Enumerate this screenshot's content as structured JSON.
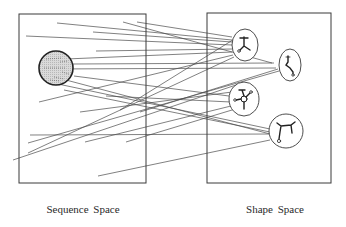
{
  "labels": {
    "sequence_space": "Sequence Space",
    "shape_space": "Shape Space"
  },
  "colors": {
    "stroke": "#3a3a3a",
    "line": "#4a4a4a",
    "sequence_circle_fill": "#d4d4d4",
    "sequence_circle_stroke": "#222222",
    "background": "#ffffff"
  },
  "boxes": {
    "sequence_space": {
      "x": 19,
      "y": 14,
      "w": 127,
      "h": 169
    },
    "shape_space": {
      "x": 207,
      "y": 13,
      "w": 124,
      "h": 170
    }
  },
  "sequence_circle": {
    "cx": 56,
    "cy": 68,
    "r": 17
  },
  "shape_nodes": [
    {
      "name": "shape-a",
      "cx": 245,
      "cy": 45,
      "rx": 13,
      "ry": 16,
      "glyph": "Y-branch"
    },
    {
      "name": "shape-b",
      "cx": 290,
      "cy": 65,
      "rx": 11,
      "ry": 16,
      "glyph": "zigzag-chain"
    },
    {
      "name": "shape-c",
      "cx": 244,
      "cy": 99,
      "rx": 15,
      "ry": 17,
      "glyph": "multi-loop"
    },
    {
      "name": "shape-d",
      "cx": 286,
      "cy": 131,
      "rx": 17,
      "ry": 17,
      "glyph": "hairpin"
    }
  ],
  "mapping_lines": [
    [
      57,
      23,
      232,
      40
    ],
    [
      123,
      22,
      272,
      63
    ],
    [
      137,
      22,
      232,
      37
    ],
    [
      93,
      32,
      232,
      42
    ],
    [
      26,
      36,
      232,
      45
    ],
    [
      96,
      51,
      232,
      49
    ],
    [
      66,
      59,
      232,
      52
    ],
    [
      72,
      64,
      274,
      63
    ],
    [
      48,
      69,
      276,
      68
    ],
    [
      74,
      76,
      229,
      96
    ],
    [
      66,
      80,
      270,
      134
    ],
    [
      58,
      84,
      270,
      129
    ],
    [
      64,
      90,
      270,
      132
    ],
    [
      39,
      102,
      233,
      55
    ],
    [
      28,
      153,
      234,
      57
    ],
    [
      28,
      143,
      279,
      71
    ],
    [
      30,
      135,
      270,
      134
    ],
    [
      85,
      142,
      231,
      106
    ],
    [
      126,
      142,
      232,
      110
    ],
    [
      98,
      176,
      270,
      140
    ],
    [
      80,
      112,
      232,
      92
    ],
    [
      106,
      96,
      231,
      102
    ],
    [
      13,
      160,
      236,
      85
    ],
    [
      140,
      112,
      278,
      69
    ],
    [
      120,
      110,
      236,
      38
    ]
  ]
}
